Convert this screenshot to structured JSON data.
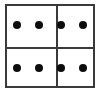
{
  "figure": {
    "background_color": "#ffffff",
    "line_color": "#3a3a3a",
    "dot_color": "#0d0d0d",
    "frame": {
      "x": 5,
      "y": 4,
      "width": 90,
      "height": 84,
      "border_width": 2
    },
    "grid": {
      "rows": 2,
      "columns": 2,
      "vertical_divider_x": 49,
      "horizontal_divider_y": 41,
      "divider_width": 2
    },
    "dot_radius": 4,
    "total_dots": 8,
    "dots_per_cell": 2,
    "cells": [
      {
        "name": "top-left",
        "row": 0,
        "column": 0,
        "dot_count": 2,
        "dots": [
          {
            "cx": 17,
            "cy": 25
          },
          {
            "cx": 39,
            "cy": 25
          }
        ]
      },
      {
        "name": "top-right",
        "row": 0,
        "column": 1,
        "dot_count": 2,
        "dots": [
          {
            "cx": 61,
            "cy": 25
          },
          {
            "cx": 83,
            "cy": 25
          }
        ]
      },
      {
        "name": "bottom-left",
        "row": 1,
        "column": 0,
        "dot_count": 2,
        "dots": [
          {
            "cx": 17,
            "cy": 68
          },
          {
            "cx": 39,
            "cy": 68
          }
        ]
      },
      {
        "name": "bottom-right",
        "row": 1,
        "column": 1,
        "dot_count": 2,
        "dots": [
          {
            "cx": 61,
            "cy": 68
          },
          {
            "cx": 83,
            "cy": 68
          }
        ]
      }
    ]
  }
}
